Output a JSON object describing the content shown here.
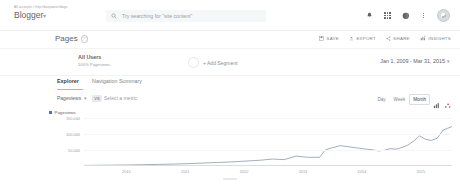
{
  "topbar": {
    "account_path": "All accounts  >  http://busjuweel.blogs",
    "account_name": "Blogger",
    "account_caret": "▾",
    "search_placeholder": "Try searching for \"site content\"",
    "icons": {
      "bell": "notifications-icon",
      "apps": "apps-grid-icon",
      "help": "help-icon",
      "overflow": "overflow-menu-icon",
      "avatar": "user-avatar"
    }
  },
  "page": {
    "title": "Pages",
    "help_badge": "?"
  },
  "toolbar": {
    "actions": [
      {
        "label": "SAVE",
        "icon": "save-icon"
      },
      {
        "label": "EXPORT",
        "icon": "export-icon"
      },
      {
        "label": "SHARE",
        "icon": "share-icon"
      },
      {
        "label": "INSIGHTS",
        "icon": "insights-icon"
      }
    ]
  },
  "segment": {
    "name": "All Users",
    "detail": "100% Pageviews",
    "add_label": "+ Add Segment"
  },
  "date_range": {
    "label": "Jan 1, 2009 - Mar 31, 2015",
    "caret": "▾"
  },
  "tabs": [
    {
      "label": "Explorer",
      "active": true
    },
    {
      "label": "Navigation Summary",
      "active": false
    }
  ],
  "metric": {
    "primary": "Pageviews",
    "caret": "▾",
    "vs": "VS",
    "secondary_placeholder": "Select a metric"
  },
  "granularity": {
    "options": [
      {
        "label": "Day",
        "active": false
      },
      {
        "label": "Week",
        "active": false
      },
      {
        "label": "Month",
        "active": true
      }
    ],
    "chart_type_icons": [
      "bar-chart-icon",
      "scatter-chart-icon"
    ]
  },
  "chart_data": {
    "type": "line",
    "title": "",
    "xlabel": "",
    "ylabel": "Pageviews",
    "legend": "Pageviews",
    "legend_color": "#3c78d8",
    "line_color": "#8a9aa8",
    "grid": true,
    "legend_position": "top-left",
    "ylim": [
      0,
      200000
    ],
    "yticks": [
      150000,
      100000,
      50000
    ],
    "ytick_labels": [
      "150,000",
      "100,000",
      "50,000"
    ],
    "xticks": [
      2010,
      2011,
      2012,
      2013,
      2014,
      2015
    ],
    "xtick_labels": [
      "2010",
      "2011",
      "2012",
      "2013",
      "2014",
      "2015"
    ],
    "x": [
      2009.0,
      2009.25,
      2009.5,
      2009.75,
      2010.0,
      2010.25,
      2010.5,
      2010.75,
      2011.0,
      2011.25,
      2011.5,
      2011.75,
      2012.0,
      2012.2,
      2012.4,
      2012.6,
      2012.8,
      2013.0,
      2013.1,
      2013.2,
      2013.35,
      2013.5,
      2013.65,
      2013.8,
      2013.9,
      2014.0,
      2014.1,
      2014.2,
      2014.3,
      2014.4,
      2014.5,
      2014.6,
      2014.7,
      2014.8,
      2014.9,
      2015.0,
      2015.1,
      2015.25
    ],
    "values": [
      2000,
      2500,
      3000,
      3500,
      4500,
      5500,
      6500,
      8000,
      10000,
      12000,
      14000,
      17000,
      20000,
      24000,
      22000,
      34000,
      30000,
      30000,
      56000,
      62000,
      70000,
      66000,
      62000,
      58000,
      56000,
      52000,
      54000,
      60000,
      58000,
      64000,
      72000,
      86000,
      104000,
      92000,
      88000,
      96000,
      124000,
      136000
    ]
  }
}
